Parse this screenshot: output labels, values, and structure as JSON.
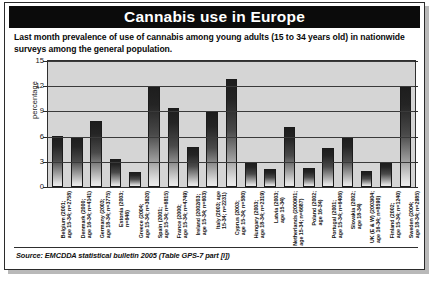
{
  "header": {
    "title": "Cannabis use in Europe"
  },
  "subtitle": "Last month prevalence of use of cannabis among young adults (15 to 34 years old) in nationwide surveys among the general population.",
  "source": "Source: EMCDDA statistical bulletin 2005 (Table GPS-7 part [i])",
  "chart_data": {
    "type": "bar",
    "title": "Cannabis use in Europe",
    "subtitle": "Last month prevalence of use of cannabis among young adults (15 to 34 years old) in nationwide surveys among the general population.",
    "xlabel": "",
    "ylabel": "percentage",
    "ylim": [
      0,
      15
    ],
    "yticks": [
      0,
      3,
      6,
      9,
      12,
      15
    ],
    "grid": true,
    "legend": false,
    "categories": [
      "Belgium (2001; age 15-34; n=2758)",
      "Denmark (2000; age 16-34; n=4141)",
      "Germany (2003; age 18-34; n=3775)",
      "Estonia (2003; n=646)",
      "Greece (2004; age 15-34; n=3620)",
      "Spain (2001; age 15-34; n=6815)",
      "France (2000; age 15-34; n=4749)",
      "Ireland (2002/03; age 15-34; n=603)",
      "Italy (2003; age 15-34; n=2231)",
      "Cyprus (2003; age 15-34; n=580)",
      "Hungary (2003; age 18-34; n=2319)",
      "Latvia (2003; age 15-34)",
      "Netherlands (2000/01; age 15-34; n=6687)",
      "Poland (2002; age 16-34)",
      "Portugal (2001; age 15-34; n=6406)",
      "Slovakia (2002; age 18-34)",
      "UK (E & W) (2003/04; age 16-34; n=8590)",
      "Finland (2002; age 15-34; n=1240)",
      "Sweden (2004; age 18-34; n=2985)"
    ],
    "category_lines": [
      [
        "Belgium (2001;",
        "age 15-34; n=2758)"
      ],
      [
        "Denmark (2000;",
        "age 16-34; n=4141)"
      ],
      [
        "Germany (2003;",
        "age 18-34; n=3775)"
      ],
      [
        "Estonia (2003;",
        "n=646)"
      ],
      [
        "Greece (2004;",
        "age 15-34; n=3620)"
      ],
      [
        "Spain (2001;",
        "age 15-34; n=6815)"
      ],
      [
        "France (2000;",
        "age 15-34; n=4749)"
      ],
      [
        "Ireland (2002/03;",
        "age 15-34; n=603)"
      ],
      [
        "Italy (2003; age",
        "15-34; n=2231)"
      ],
      [
        "Cyprus (2003;",
        "age 15-34; n=580)"
      ],
      [
        "Hungary (2003;",
        "age 18-34; n=2319)"
      ],
      [
        "Latvia (2003;",
        "age 15-34)"
      ],
      [
        "Netherlands (2000/01;",
        "age 15-34; n=6687)"
      ],
      [
        "Poland (2002;",
        "age 16-34)"
      ],
      [
        "Portugal (2001;",
        "age 15-34; n=6406)"
      ],
      [
        "Slovakia (2002;",
        "age 18-34)"
      ],
      [
        "UK (E & W) (2003/04;",
        "age 16-34; n=8590)"
      ],
      [
        "Finland (2002;",
        "age 15-34; n=1240)"
      ],
      [
        "Sweden (2004;",
        "age 18-34; n=2985)"
      ]
    ],
    "values": [
      6.1,
      5.9,
      7.8,
      3.3,
      1.8,
      12.0,
      9.4,
      4.8,
      8.9,
      12.8,
      3.0,
      2.2,
      7.2,
      2.3,
      4.6,
      5.9,
      1.9,
      3.0,
      12.0
    ]
  },
  "colors": {
    "title_bar": "#0b0b0b",
    "title_text": "#ffffff",
    "panel": "#d5d5d5",
    "bar_dark": "#1d1d1d",
    "bar_light": "#ececec",
    "axis": "#303030"
  }
}
